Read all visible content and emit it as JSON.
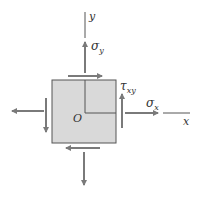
{
  "diagram": {
    "colors": {
      "element_fill": "#d9d9d9",
      "element_stroke": "#555555",
      "arrow": "#7a7a7a",
      "axis": "#555555",
      "text": "#333333"
    },
    "labels": {
      "y_axis": "y",
      "x_axis": "x",
      "origin": "O",
      "sigma_y": "σ",
      "sigma_y_sub": "y",
      "sigma_x": "σ",
      "sigma_x_sub": "x",
      "tau_xy": "τ",
      "tau_xy_sub": "xy"
    },
    "arrows": [
      {
        "name": "sigma-y-top",
        "direction": "up"
      },
      {
        "name": "sigma-y-bottom",
        "direction": "down"
      },
      {
        "name": "sigma-x-right",
        "direction": "right"
      },
      {
        "name": "sigma-x-left",
        "direction": "left"
      },
      {
        "name": "shear-top",
        "direction": "right"
      },
      {
        "name": "shear-bottom",
        "direction": "left"
      },
      {
        "name": "shear-right",
        "direction": "up"
      },
      {
        "name": "shear-left",
        "direction": "down"
      }
    ]
  }
}
